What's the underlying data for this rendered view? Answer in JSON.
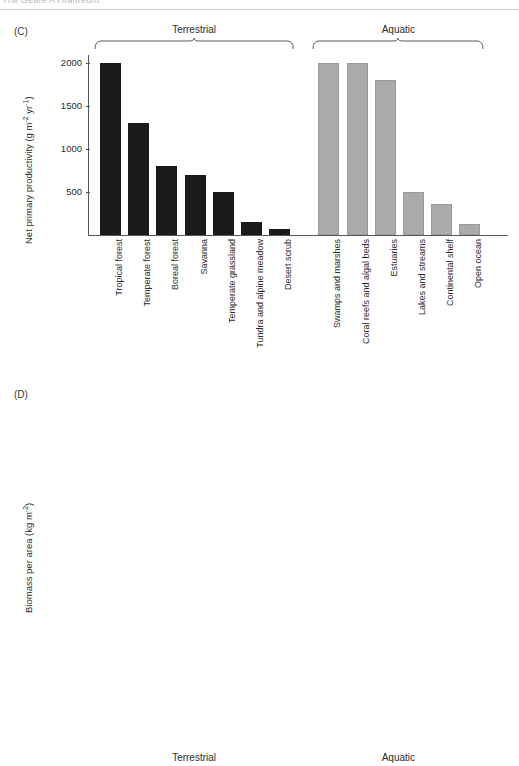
{
  "page": {
    "running_header": "The Geare A Hranreum:"
  },
  "groups": {
    "terrestrial_label": "Terrestrial",
    "aquatic_label": "Aquatic"
  },
  "panels": [
    {
      "tag": "(C)",
      "ylabel_main": "Net primary productivity (g m",
      "ylabel_sup1": "-2",
      "ylabel_mid": " yr",
      "ylabel_sup2": "-1",
      "ylabel_end": ")"
    },
    {
      "tag": "(D)",
      "ylabel_main": "Biomass per area (kg m",
      "ylabel_sup1": "-2",
      "ylabel_mid": "",
      "ylabel_sup2": "",
      "ylabel_end": ")"
    }
  ],
  "chart_data": [
    {
      "type": "bar",
      "title": "(C)",
      "xlabel": "",
      "ylabel": "Net primary productivity (g m-2 yr-1)",
      "ylim": [
        0,
        2100
      ],
      "yticks": [
        500,
        1000,
        1500,
        2000
      ],
      "grid": false,
      "legend": "none",
      "groups": [
        "Terrestrial",
        "Aquatic"
      ],
      "categories": [
        "Tropical forest",
        "Temperate forest",
        "Boreal forest",
        "Savanna",
        "Temperate grassland",
        "Tundra and alpine meadow",
        "Desert scrub",
        "Swamps and marshes",
        "Coral reefs and algal beds",
        "Estuaries",
        "Lakes and streams",
        "Continental shelf",
        "Open ocean"
      ],
      "category_groups": [
        "Terrestrial",
        "Terrestrial",
        "Terrestrial",
        "Terrestrial",
        "Terrestrial",
        "Terrestrial",
        "Terrestrial",
        "Aquatic",
        "Aquatic",
        "Aquatic",
        "Aquatic",
        "Aquatic",
        "Aquatic"
      ],
      "values": [
        2000,
        1300,
        800,
        700,
        500,
        150,
        70,
        2000,
        2000,
        1800,
        500,
        360,
        125
      ]
    },
    {
      "type": "bar",
      "title": "(D)",
      "xlabel": "",
      "ylabel": "Biomass per area (kg m-2)",
      "ylim": [
        0,
        52
      ],
      "yticks": [
        10,
        20,
        30,
        40,
        50
      ],
      "grid": false,
      "legend": "none",
      "groups": [
        "Terrestrial",
        "Aquatic"
      ],
      "categories": [
        "Tropical forest",
        "Temperate forest",
        "Boreal forest",
        "Savanna",
        "Temperate grassland",
        "Tundra and alpine meadow",
        "Desert scrub",
        "Swamps and marshes",
        "Coral reefs and algal beds",
        "Estuaries",
        "Lakes and streams",
        "Continental shelf",
        "Open ocean"
      ],
      "category_groups": [
        "Terrestrial",
        "Terrestrial",
        "Terrestrial",
        "Terrestrial",
        "Terrestrial",
        "Terrestrial",
        "Terrestrial",
        "Aquatic",
        "Aquatic",
        "Aquatic",
        "Aquatic",
        "Aquatic",
        "Aquatic"
      ],
      "values": [
        45,
        30,
        20,
        4,
        1.6,
        0.7,
        0.7,
        12.3,
        2,
        1.2,
        0.6,
        0.4,
        0.2
      ]
    }
  ]
}
